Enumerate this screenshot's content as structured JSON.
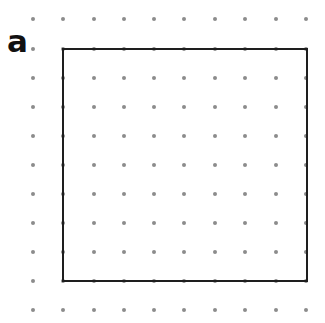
{
  "label": "a",
  "grid": {
    "columns": [
      33,
      63,
      94,
      124,
      154,
      184,
      215,
      245,
      276,
      306
    ],
    "rows": [
      19,
      49,
      78,
      107,
      136,
      165,
      194,
      223,
      252,
      281,
      310
    ],
    "dot_color": "#8c8c8c"
  },
  "square": {
    "left": 63,
    "top": 49,
    "right": 307,
    "bottom": 281,
    "stroke_color": "#1e1e1e"
  }
}
